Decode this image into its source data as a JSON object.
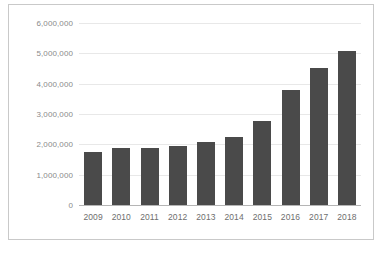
{
  "chart_data": {
    "type": "bar",
    "title": "",
    "xlabel": "",
    "ylabel": "",
    "categories": [
      "2009",
      "2010",
      "2011",
      "2012",
      "2013",
      "2014",
      "2015",
      "2016",
      "2017",
      "2018"
    ],
    "values": [
      1760000,
      1880000,
      1880000,
      1960000,
      2070000,
      2240000,
      2770000,
      3790000,
      4520000,
      5080000
    ],
    "ylim": [
      0,
      6000000
    ],
    "ytick_values": [
      0,
      1000000,
      2000000,
      3000000,
      4000000,
      5000000,
      6000000
    ],
    "ytick_labels": [
      "0",
      "1,000,000",
      "2,000,000",
      "3,000,000",
      "4,000,000",
      "5,000,000",
      "6,000,000"
    ],
    "grid": true,
    "legend": false,
    "legend_position": "none",
    "bar_color": "#4a4a4a",
    "gridline_color": "#e8e8e8",
    "axis_color": "#b5b5b5",
    "background_color": "#ffffff"
  },
  "figure": {
    "caption": "",
    "border_color": "#c9c9c9"
  }
}
